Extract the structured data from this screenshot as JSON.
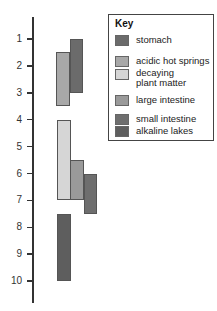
{
  "chart_data": {
    "type": "bar",
    "subtype": "floating-range",
    "title": "",
    "xlabel": "",
    "ylabel": "",
    "ylim": [
      1,
      10
    ],
    "y_inverted": true,
    "y_ticks": [
      "1",
      "2",
      "3",
      "4",
      "5",
      "6",
      "7",
      "8",
      "9",
      "10"
    ],
    "grid": false,
    "legend_position": "top-right",
    "legend_title": "Key",
    "series": [
      {
        "name": "stomach",
        "range": [
          1,
          3
        ],
        "color": "#6b6b6b"
      },
      {
        "name": "acidic hot springs",
        "range": [
          1.5,
          3.5
        ],
        "color": "#a8a8a8"
      },
      {
        "name": "decaying plant matter",
        "range": [
          4,
          7
        ],
        "color": "#d6d6d6"
      },
      {
        "name": "large intestine",
        "range": [
          5.5,
          7
        ],
        "color": "#9a9a9a"
      },
      {
        "name": "small intestine",
        "range": [
          6,
          7.5
        ],
        "color": "#6e6e6e"
      },
      {
        "name": "alkaline lakes",
        "range": [
          7.5,
          10
        ],
        "color": "#5e5e5e"
      }
    ]
  },
  "legend": {
    "title": "Key",
    "items": [
      {
        "label": "stomach"
      },
      {
        "label": "acidic hot springs"
      },
      {
        "label": "decaying\nplant matter"
      },
      {
        "label": "large intestine"
      },
      {
        "label": "small intestine"
      },
      {
        "label": "alkaline lakes"
      }
    ]
  }
}
